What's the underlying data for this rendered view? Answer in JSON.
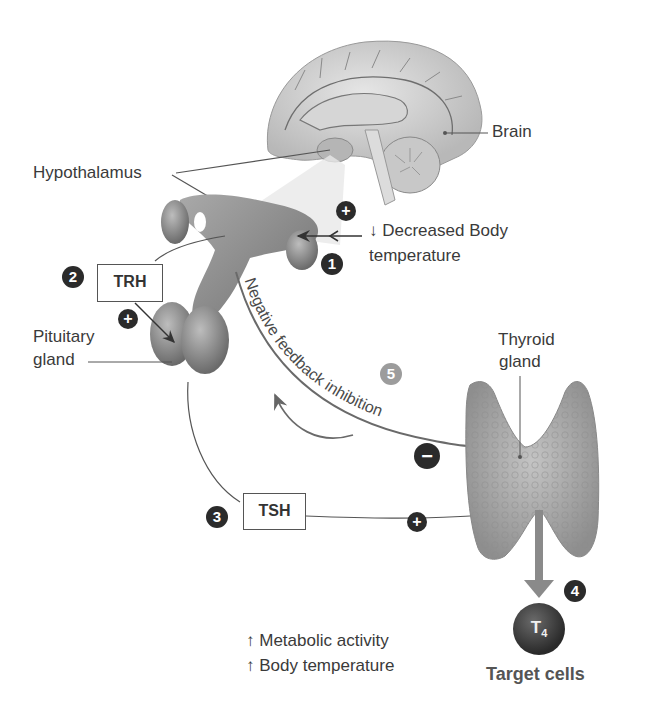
{
  "figure": {
    "type": "diagram"
  },
  "labels": {
    "brain": "Brain",
    "hypothalamus": "Hypothalamus",
    "pituitary_line1": "Pituitary",
    "pituitary_line2": "gland",
    "thyroid_line1": "Thyroid",
    "thyroid_line2": "gland",
    "stimulus_line1": "↓ Decreased Body",
    "stimulus_line2": "temperature",
    "feedback": "Negative feedback inhibition",
    "effect_line1": "↑ Metabolic activity",
    "effect_line2": "↑ Body temperature",
    "target_cells": "Target cells"
  },
  "hormones": {
    "trh": "TRH",
    "tsh": "TSH",
    "t4_main": "T",
    "t4_sub": "4"
  },
  "steps": [
    "1",
    "2",
    "3",
    "4",
    "5"
  ],
  "signs": {
    "plus": "+",
    "minus": "−"
  },
  "colors": {
    "badge_dark": "#2b2b2b",
    "badge_light": "#9c9c9c",
    "tissue": "#8a8a8a",
    "thyroid": "#a8a8a8",
    "line": "#555555"
  }
}
